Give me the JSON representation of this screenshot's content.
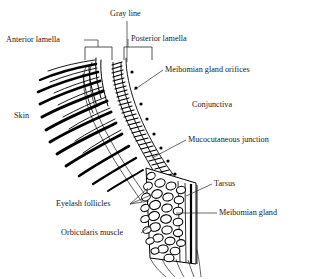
{
  "figure": {
    "type": "anatomical-cross-section",
    "palette": {
      "ink": "#000000",
      "background": "#ffffff",
      "label_ink": "#1a1a1a"
    },
    "labels": [
      {
        "id": "gray-line",
        "text": "Gray line",
        "x": 110,
        "y": 14,
        "anchor": "start"
      },
      {
        "id": "anterior-lamella",
        "text": "Anterior lamella",
        "x": 6,
        "y": 40,
        "anchor": "start"
      },
      {
        "id": "posterior-lamella",
        "text": "Posterior lamella",
        "x": 131,
        "y": 39,
        "anchor": "start"
      },
      {
        "id": "meibomian-orifices",
        "text": "Meibomian gland orifices",
        "x": 165,
        "y": 70,
        "anchor": "start"
      },
      {
        "id": "conjunctiva",
        "text": "Conjunctiva",
        "x": 192,
        "y": 105,
        "anchor": "start"
      },
      {
        "id": "skin",
        "text": "Skin",
        "x": 14,
        "y": 116,
        "anchor": "start"
      },
      {
        "id": "mucocutaneous",
        "text": "Mucocutaneous junction",
        "x": 188,
        "y": 140,
        "anchor": "start"
      },
      {
        "id": "tarsus",
        "text": "Tarsus",
        "x": 214,
        "y": 184,
        "anchor": "start"
      },
      {
        "id": "meibomian-gland",
        "text": "Meibomian gland",
        "x": 219,
        "y": 213,
        "anchor": "start"
      },
      {
        "id": "eyelash-follicles",
        "text": "Eyelash follicles",
        "x": 56,
        "y": 204,
        "anchor": "start"
      },
      {
        "id": "orbicularis-muscle",
        "text": "Orbicularis muscle",
        "x": 61,
        "y": 233,
        "anchor": "start"
      }
    ],
    "structures": [
      "eyelashes",
      "skin-surface",
      "gray-line",
      "meibomian-gland-orifices",
      "conjunctiva",
      "tarsal-plate",
      "meibomian-gland-acini",
      "eyelash-follicles",
      "orbicularis-oculi-muscle"
    ]
  }
}
